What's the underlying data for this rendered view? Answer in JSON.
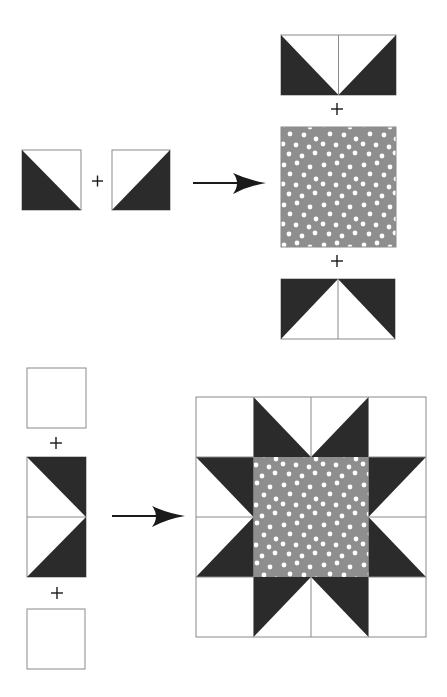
{
  "diagram": {
    "title": "",
    "colors": {
      "dark": "#2b2b2b",
      "light": "#ffffff",
      "print_background": "#8e8e8e",
      "print_dots": "#ffffff",
      "outline": "#8a8a8a",
      "symbol": "#1a1a1a"
    },
    "step1": {
      "left_units": [
        "half-square-triangle (dark lower-left)",
        "half-square-triangle (dark lower-right)"
      ],
      "join_symbol": "+",
      "result_column": [
        "flying-geese unit (dark sides, point down)",
        "+",
        "polka-dot center square",
        "+",
        "flying-geese unit (dark sides, point up)"
      ]
    },
    "step2": {
      "left_column": [
        "plain white square",
        "+",
        "flying-geese unit (point right)",
        "+",
        "plain white square"
      ],
      "result": "Sawtooth star quilt block, 4x4 grid"
    },
    "symbols": {
      "plus": "+",
      "arrow": "→"
    }
  }
}
